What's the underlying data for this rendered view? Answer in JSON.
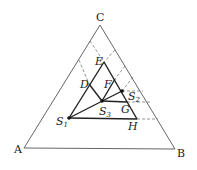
{
  "diagram": {
    "type": "ternary-phase-diagram",
    "vertices": {
      "A": {
        "label": "A",
        "x": 24,
        "y": 148
      },
      "B": {
        "label": "B",
        "x": 175,
        "y": 149
      },
      "C": {
        "label": "C",
        "x": 100,
        "y": 25
      }
    },
    "points": {
      "E": {
        "label": "E",
        "x": 104,
        "y": 62
      },
      "D": {
        "label": "D",
        "x": 89,
        "y": 84
      },
      "F": {
        "label": "F",
        "x": 115,
        "y": 79
      },
      "S1": {
        "label": "S",
        "sub": "1",
        "x": 69,
        "y": 118
      },
      "S2": {
        "label": "S",
        "sub": "2",
        "x": 122,
        "y": 91
      },
      "S3": {
        "label": "S",
        "sub": "3",
        "x": 102,
        "y": 101
      },
      "G": {
        "label": "G",
        "x": 127,
        "y": 102
      },
      "H": {
        "label": "H",
        "x": 137,
        "y": 119
      }
    },
    "colors": {
      "outline": "#555555",
      "thick": "#222222",
      "dashed": "#666666",
      "text": "#222222"
    }
  }
}
